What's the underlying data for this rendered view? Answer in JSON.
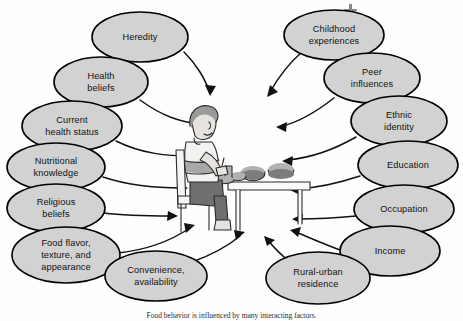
{
  "figure": {
    "type": "concept-diagram",
    "center_illustration": "person-eating-at-table",
    "colors": {
      "node_fill": "#d2d2d2",
      "node_stroke": "#000000",
      "arrow": "#111111",
      "background": "#fefefe"
    }
  },
  "nodes": {
    "left": [
      {
        "id": "heredity",
        "label": "Heredity",
        "lines": [
          "Heredity"
        ],
        "cx": 140,
        "cy": 37,
        "rx": 48,
        "ry": 25
      },
      {
        "id": "health-beliefs",
        "label": "Health beliefs",
        "lines": [
          "Health",
          "beliefs"
        ],
        "cx": 101,
        "cy": 82,
        "rx": 47,
        "ry": 25
      },
      {
        "id": "current-health-status",
        "label": "Current health status",
        "lines": [
          "Current",
          "health status"
        ],
        "cx": 72,
        "cy": 126,
        "rx": 50,
        "ry": 25
      },
      {
        "id": "nutritional-knowledge",
        "label": "Nutritional knowledge",
        "lines": [
          "Nutritional",
          "knowledge"
        ],
        "cx": 56,
        "cy": 167,
        "rx": 49,
        "ry": 24
      },
      {
        "id": "religious-beliefs",
        "label": "Religious beliefs",
        "lines": [
          "Religious",
          "beliefs"
        ],
        "cx": 56,
        "cy": 208,
        "rx": 49,
        "ry": 24
      },
      {
        "id": "food-flavor-texture-appearance",
        "label": "Food flavor, texture, and appearance",
        "lines": [
          "Food flavor,",
          "texture, and",
          "appearance"
        ],
        "cx": 66,
        "cy": 255,
        "rx": 54,
        "ry": 28
      },
      {
        "id": "convenience-availability",
        "label": "Convenience, availability",
        "lines": [
          "Convenience,",
          "availability"
        ],
        "cx": 156,
        "cy": 276,
        "rx": 51,
        "ry": 25
      }
    ],
    "right": [
      {
        "id": "childhood-experiences",
        "label": "Childhood experiences",
        "lines": [
          "Childhood",
          "experiences"
        ],
        "cx": 334,
        "cy": 35,
        "rx": 50,
        "ry": 25
      },
      {
        "id": "peer-influences",
        "label": "Peer influences",
        "lines": [
          "Peer",
          "influences"
        ],
        "cx": 372,
        "cy": 78,
        "rx": 48,
        "ry": 25
      },
      {
        "id": "ethnic-identity",
        "label": "Ethnic identity",
        "lines": [
          "Ethnic",
          "identity"
        ],
        "cx": 399,
        "cy": 121,
        "rx": 48,
        "ry": 25
      },
      {
        "id": "education",
        "label": "Education",
        "lines": [
          "Education"
        ],
        "cx": 408,
        "cy": 165,
        "rx": 50,
        "ry": 24
      },
      {
        "id": "occupation",
        "label": "Occupation",
        "lines": [
          "Occupation"
        ],
        "cx": 404,
        "cy": 209,
        "rx": 50,
        "ry": 24
      },
      {
        "id": "income",
        "label": "Income",
        "lines": [
          "Income"
        ],
        "cx": 390,
        "cy": 251,
        "rx": 50,
        "ry": 25
      },
      {
        "id": "rural-urban-residence",
        "label": "Rural-urban residence",
        "lines": [
          "Rural-urban",
          "residence"
        ],
        "cx": 318,
        "cy": 278,
        "rx": 52,
        "ry": 26
      }
    ]
  },
  "caption": {
    "text": "Food behavior is influenced by many interacting factors."
  }
}
